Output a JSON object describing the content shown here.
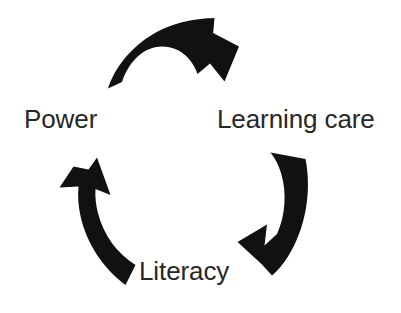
{
  "diagram": {
    "type": "cycle",
    "title": "",
    "background_color": "#ffffff",
    "arrow_color": "#111111",
    "label_color": "#272727",
    "direction": "clockwise",
    "nodes": [
      {
        "id": "learning-care",
        "label": "Learning care",
        "position": "top-right"
      },
      {
        "id": "literacy",
        "label": "Literacy",
        "position": "bottom-center"
      },
      {
        "id": "power",
        "label": "Power",
        "position": "top-left"
      }
    ],
    "arrows": [
      {
        "id": "arrow-top",
        "from": "power",
        "to": "learning-care",
        "orientation": "top-curve-right"
      },
      {
        "id": "arrow-right",
        "from": "learning-care",
        "to": "literacy",
        "orientation": "right-curve-down-left"
      },
      {
        "id": "arrow-left",
        "from": "literacy",
        "to": "power",
        "orientation": "left-curve-up"
      }
    ]
  }
}
